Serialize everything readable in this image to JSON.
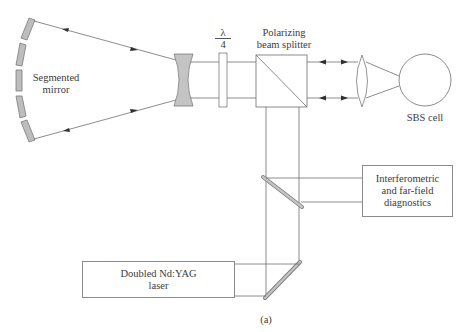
{
  "diagram": {
    "type": "optical-setup",
    "components": {
      "segmented_mirror": {
        "label_lines": [
          "Segmented",
          "mirror"
        ],
        "segments": 5,
        "color": "#bdbdbd"
      },
      "negative_lens": {
        "color": "#c4c4c4"
      },
      "quarter_wave_plate": {
        "label_top": "λ",
        "label_bottom": "4"
      },
      "beam_splitter": {
        "label_lines": [
          "Polarizing",
          "beam splitter"
        ]
      },
      "positive_lens": {},
      "sbs_cell": {
        "label": "SBS cell"
      },
      "diagnostics": {
        "label_lines": [
          "Interferometric",
          "and far-field",
          "diagnostics"
        ]
      },
      "laser": {
        "label_lines": [
          "Doubled Nd:YAG",
          "laser"
        ]
      },
      "turning_mirrors": 2
    },
    "caption": "(a)",
    "colors": {
      "line": "#6e6e6e",
      "mirror_fill": "#bdbdbd",
      "box_border": "#8a8a8a"
    }
  }
}
